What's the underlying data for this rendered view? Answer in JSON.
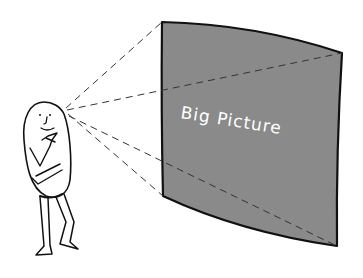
{
  "illustration": {
    "screen_label": "Big Picture",
    "colors": {
      "background": "#ffffff",
      "screen_fill": "#8a8a8a",
      "outline": "#111111",
      "dash_line": "#333333",
      "text": "#ffffff"
    },
    "elements": {
      "figure": "cartoon bean-shaped person, hand on chin, thinking",
      "screen": "large gray curved projection screen",
      "sight_lines": "dashed lines radiating from the figure's eye to screen corners"
    }
  }
}
